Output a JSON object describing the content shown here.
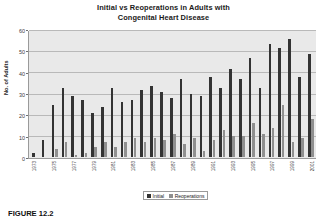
{
  "chart_data": {
    "type": "bar",
    "title": "Initial vs Reoperations in Adults with Congenital Heart Disease",
    "title_line1": "Initial vs Reoperations in Adults with",
    "title_line2": "Congenital Heart Disease",
    "xlabel": "",
    "ylabel": "No. of Adults",
    "ylim": [
      0,
      60
    ],
    "yticks": [
      0,
      10,
      20,
      30,
      40,
      50,
      60
    ],
    "ytick_labels": [
      "0",
      "10",
      "20",
      "30",
      "40",
      "50",
      "60"
    ],
    "grid": true,
    "legend_position": "bottom-right",
    "categories": [
      "1973",
      "1974",
      "1975",
      "1976",
      "1977",
      "1978",
      "1979",
      "1980",
      "1981",
      "1982",
      "1983",
      "1984",
      "1985",
      "1986",
      "1987",
      "1988",
      "1989",
      "1990",
      "1991",
      "1992",
      "1993",
      "1994",
      "1995",
      "1996",
      "1997",
      "1998",
      "1999",
      "2000",
      "2001"
    ],
    "xtick_labels": [
      "1973",
      "",
      "1975",
      "",
      "1977",
      "",
      "1979",
      "",
      "1981",
      "",
      "1983",
      "",
      "1985",
      "",
      "1987",
      "",
      "1989",
      "",
      "1991",
      "",
      "1993",
      "",
      "1995",
      "",
      "1997",
      "",
      "1999",
      "",
      "2001"
    ],
    "series": [
      {
        "name": "Initial",
        "color": "#333333",
        "values": [
          2,
          8,
          25,
          33,
          29,
          27,
          21,
          24,
          33,
          26,
          27,
          32,
          34,
          31,
          28,
          37,
          30,
          29,
          38,
          33,
          42,
          37,
          47,
          33,
          54,
          52,
          56,
          38,
          49
        ]
      },
      {
        "name": "Reoperations",
        "color": "#8F8F8F",
        "values": [
          0,
          0,
          4,
          7,
          1,
          2,
          5,
          7,
          5,
          7,
          9,
          7,
          9,
          8,
          11,
          6,
          9,
          3,
          8,
          13,
          10,
          10,
          16,
          11,
          14,
          25,
          7,
          9,
          18
        ]
      }
    ]
  },
  "legend": {
    "items": [
      {
        "label": "Initial",
        "color": "#333333"
      },
      {
        "label": "Reoperations",
        "color": "#8F8F8F"
      }
    ]
  },
  "caption": {
    "figure_label": "FIGURE 12.2",
    "text": ""
  }
}
